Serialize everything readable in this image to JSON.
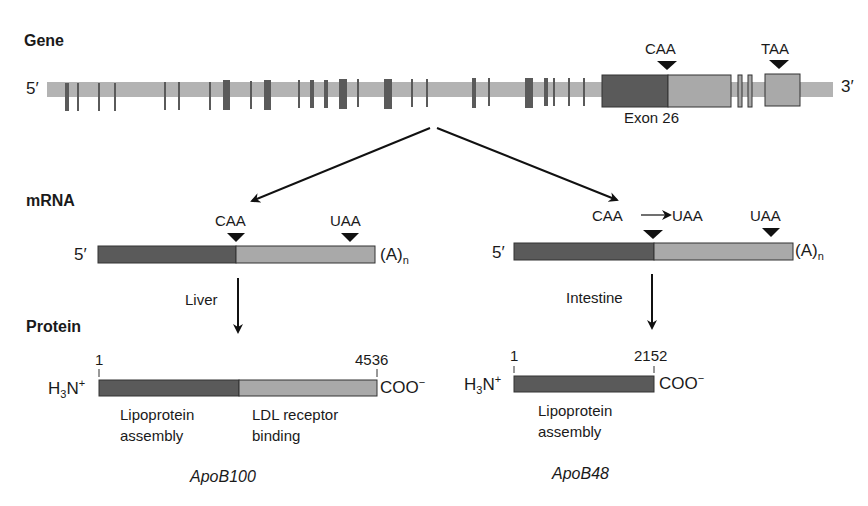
{
  "colors": {
    "intron_bar": "#b3b3b3",
    "exon_dark": "#5a5a5a",
    "exon_light": "#a9a9a9",
    "outline": "#333333",
    "text": "#1a1a1a"
  },
  "gene": {
    "section_label": "Gene",
    "five_prime": "5′",
    "three_prime": "3′",
    "codon_caa": "CAA",
    "codon_taa": "TAA",
    "exon_label": "Exon 26"
  },
  "mrna": {
    "section_label": "mRNA",
    "left": {
      "five_prime": "5′",
      "codon_caa": "CAA",
      "codon_uaa": "UAA",
      "polya": "(A)",
      "polya_sub": "n",
      "tissue": "Liver"
    },
    "right": {
      "five_prime": "5′",
      "codon_edit_from": "CAA",
      "codon_edit_to": "UAA",
      "codon_uaa": "UAA",
      "polya": "(A)",
      "polya_sub": "n",
      "tissue": "Intestine"
    }
  },
  "protein": {
    "section_label": "Protein",
    "left": {
      "n_term": "H",
      "n_term_sub": "3",
      "n_term_rest": "N",
      "n_term_sup": "+",
      "start_pos": "1",
      "end_pos": "4536",
      "c_term": "COO",
      "c_term_sup": "−",
      "domain1_line1": "Lipoprotein",
      "domain1_line2": "assembly",
      "domain2_line1": "LDL receptor",
      "domain2_line2": "binding",
      "name": "ApoB100"
    },
    "right": {
      "n_term": "H",
      "n_term_sub": "3",
      "n_term_rest": "N",
      "n_term_sup": "+",
      "start_pos": "1",
      "end_pos": "2152",
      "c_term": "COO",
      "c_term_sup": "−",
      "domain1_line1": "Lipoprotein",
      "domain1_line2": "assembly",
      "name": "ApoB48"
    }
  }
}
